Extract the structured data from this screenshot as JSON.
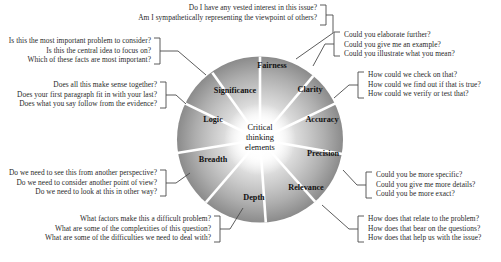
{
  "diagram": {
    "center": {
      "line1": "Critical",
      "line2": "thinking",
      "line3": "elements"
    },
    "elements": [
      {
        "key": "fairness",
        "label": "Fairness",
        "questions": [
          "Do I have any vested interest in this issue?",
          "Am I sympathetically representing the viewpoint of others?"
        ]
      },
      {
        "key": "clarity",
        "label": "Clarity",
        "questions": [
          "Could you elaborate further?",
          "Could you give me an example?",
          "Could you illustrate what you mean?"
        ]
      },
      {
        "key": "accuracy",
        "label": "Accuracy",
        "questions": [
          "How could we check on that?",
          "How could we find out if that is true?",
          "How could we verify or test that?"
        ]
      },
      {
        "key": "precision",
        "label": "Precision",
        "questions": [
          "Could you be more specific?",
          "Could you give me more details?",
          "Could you be more exact?"
        ]
      },
      {
        "key": "relevance",
        "label": "Relevance",
        "questions": [
          "How does that relate to the problem?",
          "How does that bear on the questions?",
          "How does that help us with the issue?"
        ]
      },
      {
        "key": "depth",
        "label": "Depth",
        "questions": [
          "What factors make this a difficult problem?",
          "What are some of the complexities of this question?",
          "What are some of the difficulties we need to deal with?"
        ]
      },
      {
        "key": "breadth",
        "label": "Breadth",
        "questions": [
          "Do we need to see this from another perspective?",
          "Do we need to consider another point of view?",
          "Do we need to look at this in other way?"
        ]
      },
      {
        "key": "logic",
        "label": "Logic",
        "questions": [
          "Does all this make sense together?",
          "Does your first paragraph fit in with your last?",
          "Does what you say follow from the evidence?"
        ]
      },
      {
        "key": "significance",
        "label": "Significance",
        "questions": [
          "Is this the most important problem to consider?",
          "Is this the central idea to focus on?",
          "Which of these facts are most important?"
        ]
      }
    ],
    "colors": {
      "wheel_center": "#ffffff",
      "wheel_edge": "#8d8d8d",
      "spoke": "#ffffff",
      "connector": "#4a4a4a",
      "text": "#2a2a2a"
    }
  }
}
